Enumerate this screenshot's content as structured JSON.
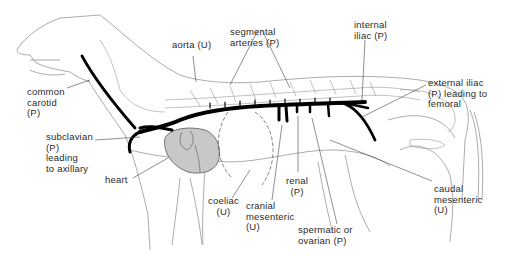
{
  "diagram": {
    "legend_codes": {
      "P": "paired",
      "U": "unpaired"
    },
    "colors": {
      "artery": "#000000",
      "outline": "#777777",
      "heart": "#c8c8c8",
      "text": "#2a2a2a"
    },
    "labels": {
      "common_carotid": "common\ncarotid\n(P)",
      "aorta": "aorta (U)",
      "segmental_arteries": "segmental\narteries (P)",
      "internal_iliac": "internal\niliac (P)",
      "external_iliac": "external iliac\n(P) leading to\nfemoral",
      "subclavian": "subclavian\n(P)\nleading\nto axillary",
      "heart": "heart",
      "coeliac": "coeliac\n(U)",
      "cranial_mesenteric": "cranial\nmesenteric\n(U)",
      "renal": "renal\n(P)",
      "spermatic_ovarian": "spermatic or\novarian (P)",
      "caudal_mesenteric": "caudal\nmesenteric\n(U)"
    }
  }
}
